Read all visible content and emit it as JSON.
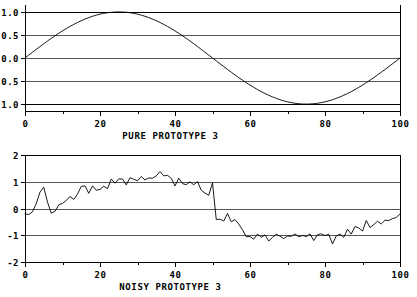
{
  "figure": {
    "background_color": "#ffffff",
    "foreground_color": "#000000",
    "grid_color": "#555555"
  },
  "chart_data": [
    {
      "type": "line",
      "id": "pure-prototype-3",
      "title": "",
      "xlabel": "PURE PROTOTYPE 3",
      "ylabel": "",
      "grid": true,
      "legend": null,
      "xlim": [
        0,
        100
      ],
      "ylim": [
        -1.15,
        1.15
      ],
      "xticks": [
        0,
        20,
        40,
        60,
        80,
        100
      ],
      "xticklabels": [
        "0",
        "20",
        "40",
        "60",
        "80",
        "100"
      ],
      "xminorticks": [
        10,
        30,
        50,
        70,
        90
      ],
      "yticks": [
        -1.0,
        -0.5,
        0.0,
        0.5,
        1.0
      ],
      "yticklabels": [
        "-1.0",
        "-0.5",
        "0.0",
        "0.5",
        "1.0"
      ],
      "description": "One full period of a sine wave, amplitude 1.0, starting at 0 rising to peak near x=25 and trough near x=75.",
      "x": [
        0,
        1,
        2,
        3,
        4,
        5,
        6,
        7,
        8,
        9,
        10,
        11,
        12,
        13,
        14,
        15,
        16,
        17,
        18,
        19,
        20,
        21,
        22,
        23,
        24,
        25,
        26,
        27,
        28,
        29,
        30,
        31,
        32,
        33,
        34,
        35,
        36,
        37,
        38,
        39,
        40,
        41,
        42,
        43,
        44,
        45,
        46,
        47,
        48,
        49,
        50,
        51,
        52,
        53,
        54,
        55,
        56,
        57,
        58,
        59,
        60,
        61,
        62,
        63,
        64,
        65,
        66,
        67,
        68,
        69,
        70,
        71,
        72,
        73,
        74,
        75,
        76,
        77,
        78,
        79,
        80,
        81,
        82,
        83,
        84,
        85,
        86,
        87,
        88,
        89,
        90,
        91,
        92,
        93,
        94,
        95,
        96,
        97,
        98,
        99,
        100
      ],
      "values": [
        0.0,
        0.063,
        0.125,
        0.187,
        0.249,
        0.309,
        0.368,
        0.426,
        0.482,
        0.536,
        0.588,
        0.637,
        0.685,
        0.729,
        0.771,
        0.809,
        0.844,
        0.876,
        0.905,
        0.93,
        0.951,
        0.968,
        0.982,
        0.992,
        0.998,
        1.0,
        0.998,
        0.992,
        0.982,
        0.968,
        0.951,
        0.93,
        0.905,
        0.876,
        0.844,
        0.809,
        0.771,
        0.729,
        0.685,
        0.637,
        0.588,
        0.536,
        0.482,
        0.426,
        0.368,
        0.309,
        0.249,
        0.187,
        0.125,
        0.063,
        0.0,
        -0.063,
        -0.125,
        -0.187,
        -0.249,
        -0.309,
        -0.368,
        -0.426,
        -0.482,
        -0.536,
        -0.588,
        -0.637,
        -0.685,
        -0.729,
        -0.771,
        -0.809,
        -0.844,
        -0.876,
        -0.905,
        -0.93,
        -0.951,
        -0.968,
        -0.982,
        -0.992,
        -0.998,
        -1.0,
        -0.998,
        -0.992,
        -0.982,
        -0.968,
        -0.951,
        -0.93,
        -0.905,
        -0.876,
        -0.844,
        -0.809,
        -0.771,
        -0.729,
        -0.685,
        -0.637,
        -0.588,
        -0.536,
        -0.482,
        -0.426,
        -0.368,
        -0.309,
        -0.249,
        -0.187,
        -0.125,
        -0.063,
        0.0
      ]
    },
    {
      "type": "line",
      "id": "noisy-prototype-3",
      "title": "",
      "xlabel": "NOISY PROTOTYPE 3",
      "ylabel": "",
      "grid": true,
      "legend": null,
      "xlim": [
        0,
        100
      ],
      "ylim": [
        -2.0,
        2.0
      ],
      "xticks": [
        0,
        20,
        40,
        60,
        80,
        100
      ],
      "xticklabels": [
        "0",
        "20",
        "40",
        "60",
        "80",
        "100"
      ],
      "xminorticks": [
        10,
        30,
        50,
        70,
        90
      ],
      "yticks": [
        -2,
        -1,
        0,
        1,
        2
      ],
      "yticklabels": [
        "-2",
        "-1",
        "0",
        "1",
        "2"
      ],
      "description": "The same sine wave corrupted by additive random noise; oscillates about the sine envelope with amplitude roughly +-0.4.",
      "x": [
        0,
        1,
        2,
        3,
        4,
        5,
        6,
        7,
        8,
        9,
        10,
        11,
        12,
        13,
        14,
        15,
        16,
        17,
        18,
        19,
        20,
        21,
        22,
        23,
        24,
        25,
        26,
        27,
        28,
        29,
        30,
        31,
        32,
        33,
        34,
        35,
        36,
        37,
        38,
        39,
        40,
        41,
        42,
        43,
        44,
        45,
        46,
        47,
        48,
        49,
        50,
        51,
        52,
        53,
        54,
        55,
        56,
        57,
        58,
        59,
        60,
        61,
        62,
        63,
        64,
        65,
        66,
        67,
        68,
        69,
        70,
        71,
        72,
        73,
        74,
        75,
        76,
        77,
        78,
        79,
        80,
        81,
        82,
        83,
        84,
        85,
        86,
        87,
        88,
        89,
        90,
        91,
        92,
        93,
        94,
        95,
        96,
        97,
        98,
        99,
        100
      ],
      "values": [
        -0.2,
        -0.24,
        -0.18,
        -0.05,
        0.3,
        0.66,
        0.84,
        0.4,
        -0.1,
        -0.24,
        -0.06,
        0.14,
        0.16,
        0.32,
        0.27,
        0.55,
        0.3,
        0.52,
        0.75,
        1.0,
        0.7,
        0.52,
        0.86,
        0.66,
        0.78,
        0.62,
        0.96,
        0.7,
        1.12,
        0.76,
        1.42,
        0.8,
        1.22,
        0.86,
        1.18,
        1.0,
        1.24,
        0.9,
        1.26,
        1.06,
        1.22,
        0.92,
        1.36,
        1.16,
        1.4,
        1.2,
        1.34,
        1.06,
        1.18,
        0.76,
        1.14,
        0.9,
        1.02,
        0.74,
        1.12,
        0.86,
        1.06,
        0.62,
        0.8,
        0.4,
        0.52,
        0.96,
        1.18,
        0.86,
        1.16,
        0.56,
        1.2,
        0.82,
        0.5,
        0.34,
        0.6,
        0.52,
        0.72,
        0.44,
        0.66,
        0.52,
        0.76,
        0.4,
        0.5,
        0.28,
        0.56,
        0.32,
        0.5,
        0.14,
        0.44,
        0.2,
        0.46,
        0.22,
        0.36,
        -0.04,
        0.24,
        0.14,
        0.32,
        -0.3,
        0.16,
        -0.08,
        0.26,
        -0.1,
        0.06,
        -0.2,
        0.1
      ]
    }
  ],
  "noisy_extra": {
    "values_tail": [
      -0.46,
      -0.24,
      -0.6,
      -0.4,
      -0.16,
      -0.52,
      -0.28,
      -0.7,
      -0.48,
      -0.9,
      -1.06,
      -1.0,
      -1.24,
      -1.02,
      -0.92,
      -1.1,
      -0.96,
      -1.3,
      -1.02,
      -1.14,
      -0.9,
      -1.04,
      -1.16,
      -0.98,
      -1.1,
      -1.0,
      -0.94,
      -1.06,
      -1.02,
      -0.98,
      -1.12,
      -0.88,
      -1.22,
      -0.96,
      -1.06,
      -0.76,
      -1.18,
      -0.92,
      -1.34,
      -1.0,
      -1.1,
      -0.8,
      -1.2,
      -0.74,
      -1.02,
      -0.56,
      -0.88,
      -0.62,
      -0.9,
      -0.44,
      -0.78,
      -0.5,
      -0.72,
      -0.36,
      -0.6,
      -0.42,
      -0.56,
      -0.24,
      -0.48,
      -0.3,
      -0.2
    ]
  },
  "labels": {
    "top_xlabel": "PURE PROTOTYPE 3",
    "bottom_xlabel": "NOISY PROTOTYPE 3"
  }
}
